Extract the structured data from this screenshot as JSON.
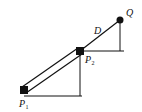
{
  "diagram": {
    "labels": {
      "q": "Q",
      "d": "D",
      "p2_main": "P",
      "p2_sub": "2",
      "p1_main": "P",
      "p1_sub": "1"
    },
    "colors": {
      "ink": "#111111",
      "background": "#ffffff"
    }
  }
}
